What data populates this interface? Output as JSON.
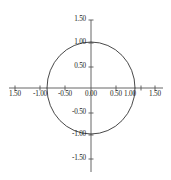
{
  "chart_data": {
    "type": "line",
    "title": "",
    "subtitle": "",
    "xlabel": "",
    "ylabel": "",
    "xlim": [
      -1.75,
      1.75
    ],
    "ylim": [
      -1.75,
      1.75
    ],
    "grid": false,
    "legend": false,
    "legend_position": "none",
    "annotations": [],
    "curve": {
      "name": "unit circle",
      "equation": "x^2 + y^2 = 1",
      "center": [
        0.0,
        0.0
      ],
      "radius": 1.0,
      "color": "#1a1a1a",
      "linewidth": 0.8,
      "closed": true,
      "key_points": [
        [
          1.0,
          0.0
        ],
        [
          0.0,
          1.0
        ],
        [
          -1.0,
          0.0
        ],
        [
          0.0,
          -1.0
        ]
      ]
    },
    "axes": {
      "x_axis_color": "#555555",
      "y_axis_color": "#555555",
      "x_ticks": [
        -1.5,
        -1.0,
        -0.5,
        0.0,
        0.5,
        1.0,
        1.5
      ],
      "y_ticks": [
        -1.5,
        -1.0,
        -0.5,
        0.5,
        1.0,
        1.5
      ]
    },
    "x_tick_labels": [
      "1.50",
      "-1.00",
      "-0.50",
      "0.00",
      "0.50",
      "1.00",
      "1.50"
    ],
    "y_tick_labels": [
      "1.50",
      "1.00",
      "0.50",
      "-0.50",
      "-1.00",
      "-1.50"
    ]
  },
  "x_axis": {
    "ticks": [
      {
        "value": -1.5,
        "label": "1.50",
        "px": 15
      },
      {
        "value": -1.0,
        "label": "-1.00",
        "px": 40
      },
      {
        "value": -0.5,
        "label": "-0.50",
        "px": 65
      },
      {
        "value": 0.0,
        "label": "0.00",
        "px": 91
      },
      {
        "value": 0.5,
        "label": "0.50",
        "px": 116
      },
      {
        "value": 1.0,
        "label": "1.00",
        "px": 129
      },
      {
        "value": 1.5,
        "label": "1.50",
        "px": 155
      }
    ]
  },
  "y_axis": {
    "ticks": [
      {
        "value": 1.5,
        "label": "1.50",
        "px": 20
      },
      {
        "value": 1.0,
        "label": "1.00",
        "px": 43
      },
      {
        "value": 0.5,
        "label": "0.50",
        "px": 67
      },
      {
        "value": -0.5,
        "label": "-0.50",
        "px": 113
      },
      {
        "value": -1.0,
        "label": "-1.00",
        "px": 135
      },
      {
        "value": -1.5,
        "label": "-1.50",
        "px": 159
      }
    ]
  },
  "geometry": {
    "origin_x": 91,
    "origin_y": 88,
    "radius_x": 44,
    "radius_y": 46
  }
}
